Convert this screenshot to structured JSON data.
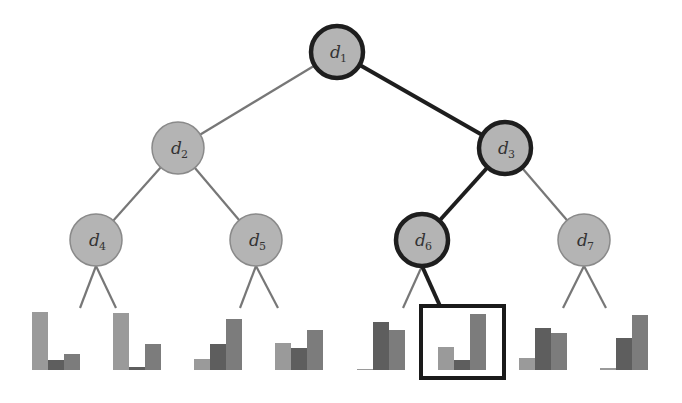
{
  "colors": {
    "node_fill": "#b4b4b4",
    "node_stroke_default": "#8a8a8a",
    "node_stroke_path": "#1e1e1e",
    "edge_default": "#777777",
    "edge_path": "#1e1e1e",
    "bar_light": "#9a9a9a",
    "bar_dark": "#5e5e5e",
    "bar_mid": "#7c7c7c",
    "highlight_box": "#1a1a1a"
  },
  "tree": {
    "nodes": [
      {
        "id": "d1",
        "base": "d",
        "sub": "1",
        "x": 337,
        "y": 52,
        "on_path": true
      },
      {
        "id": "d2",
        "base": "d",
        "sub": "2",
        "x": 178,
        "y": 148,
        "on_path": false
      },
      {
        "id": "d3",
        "base": "d",
        "sub": "3",
        "x": 505,
        "y": 148,
        "on_path": true
      },
      {
        "id": "d4",
        "base": "d",
        "sub": "4",
        "x": 96,
        "y": 240,
        "on_path": false
      },
      {
        "id": "d5",
        "base": "d",
        "sub": "5",
        "x": 256,
        "y": 240,
        "on_path": false
      },
      {
        "id": "d6",
        "base": "d",
        "sub": "6",
        "x": 422,
        "y": 240,
        "on_path": true
      },
      {
        "id": "d7",
        "base": "d",
        "sub": "7",
        "x": 584,
        "y": 240,
        "on_path": false
      }
    ],
    "radius": 26,
    "edges": [
      {
        "from": "d1",
        "to": "d2",
        "on_path": false
      },
      {
        "from": "d1",
        "to": "d3",
        "on_path": true
      },
      {
        "from": "d2",
        "to": "d4",
        "on_path": false
      },
      {
        "from": "d2",
        "to": "d5",
        "on_path": false
      },
      {
        "from": "d3",
        "to": "d6",
        "on_path": true
      },
      {
        "from": "d3",
        "to": "d7",
        "on_path": false
      }
    ],
    "leaf_edges": [
      {
        "x1": 96,
        "y1": 266,
        "x2": 80,
        "y2": 308,
        "on_path": false
      },
      {
        "x1": 96,
        "y1": 266,
        "x2": 116,
        "y2": 308,
        "on_path": false
      },
      {
        "x1": 256,
        "y1": 266,
        "x2": 240,
        "y2": 308,
        "on_path": false
      },
      {
        "x1": 256,
        "y1": 266,
        "x2": 278,
        "y2": 308,
        "on_path": false
      },
      {
        "x1": 422,
        "y1": 266,
        "x2": 403,
        "y2": 308,
        "on_path": false
      },
      {
        "x1": 422,
        "y1": 266,
        "x2": 440,
        "y2": 306,
        "on_path": true
      },
      {
        "x1": 584,
        "y1": 266,
        "x2": 563,
        "y2": 308,
        "on_path": false
      },
      {
        "x1": 584,
        "y1": 266,
        "x2": 606,
        "y2": 308,
        "on_path": false
      }
    ]
  },
  "leaves": {
    "baseline": 370,
    "bar_width": 16,
    "groups": [
      {
        "x": 32,
        "heights": [
          58,
          10,
          16
        ],
        "selected": false
      },
      {
        "x": 113,
        "heights": [
          57,
          3,
          26
        ],
        "selected": false
      },
      {
        "x": 194,
        "heights": [
          11,
          26,
          51
        ],
        "selected": false
      },
      {
        "x": 275,
        "heights": [
          27,
          22,
          40
        ],
        "selected": false
      },
      {
        "x": 357,
        "heights": [
          1,
          48,
          40
        ],
        "selected": false
      },
      {
        "x": 438,
        "heights": [
          23,
          10,
          56
        ],
        "selected": true
      },
      {
        "x": 519,
        "heights": [
          12,
          42,
          37
        ],
        "selected": false
      },
      {
        "x": 600,
        "heights": [
          2,
          32,
          55
        ],
        "selected": false
      }
    ],
    "highlight_box": {
      "x": 421,
      "y": 306,
      "width": 83,
      "height": 72
    }
  }
}
